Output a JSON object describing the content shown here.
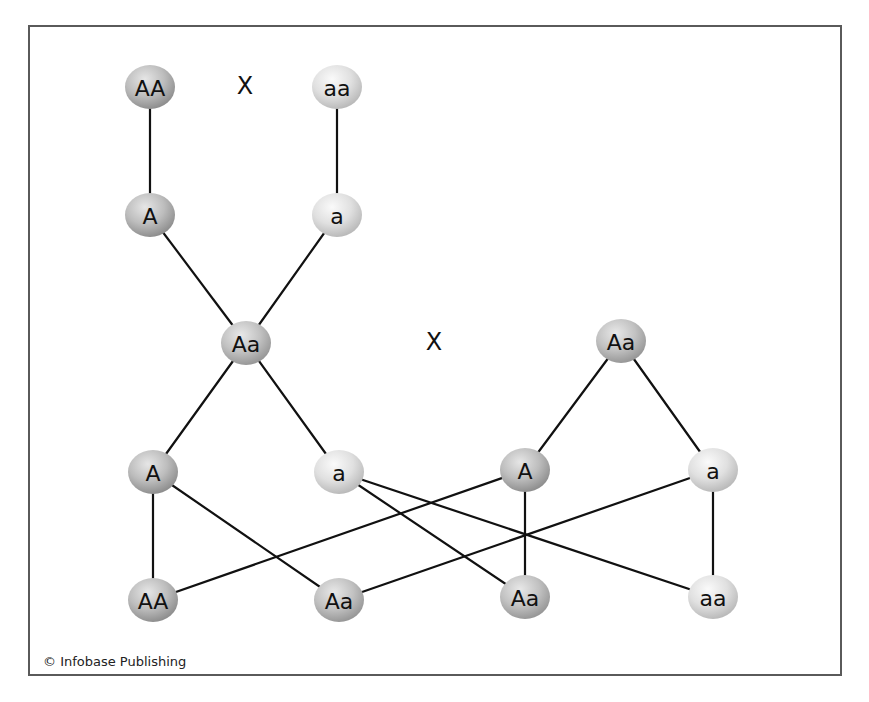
{
  "diagram": {
    "colors": {
      "border": "#5a5a5a",
      "edge": "#111111",
      "dominant_dark": "#9c9c9c",
      "dominant_light": "#dedede",
      "hetero_dark": "#a6a6a6",
      "hetero_light": "#e2e2e2",
      "recessive_dark": "#c4c4c4",
      "recessive_light": "#f4f4f4"
    },
    "cross_symbols": [
      {
        "id": "cross-top",
        "label": "X",
        "x": 245,
        "y": 86
      },
      {
        "id": "cross-middle",
        "label": "X",
        "x": 434,
        "y": 342
      }
    ],
    "nodes": [
      {
        "id": "p1",
        "label": "AA",
        "kind": "dominant",
        "x": 150,
        "y": 87,
        "role": "parent genotype"
      },
      {
        "id": "p2",
        "label": "aa",
        "kind": "recessive",
        "x": 337,
        "y": 87,
        "role": "parent genotype"
      },
      {
        "id": "g1",
        "label": "A",
        "kind": "dominant",
        "x": 150,
        "y": 215,
        "role": "parent gamete"
      },
      {
        "id": "g2",
        "label": "a",
        "kind": "recessive",
        "x": 337,
        "y": 215,
        "role": "parent gamete"
      },
      {
        "id": "f1a",
        "label": "Aa",
        "kind": "hetero",
        "x": 246,
        "y": 343,
        "role": "F1 genotype"
      },
      {
        "id": "f1b",
        "label": "Aa",
        "kind": "hetero",
        "x": 621,
        "y": 341,
        "role": "F1 genotype"
      },
      {
        "id": "f1a_g1",
        "label": "A",
        "kind": "dominant",
        "x": 153,
        "y": 472,
        "role": "F1 gamete"
      },
      {
        "id": "f1a_g2",
        "label": "a",
        "kind": "recessive",
        "x": 339,
        "y": 472,
        "role": "F1 gamete"
      },
      {
        "id": "f1b_g1",
        "label": "A",
        "kind": "dominant",
        "x": 525,
        "y": 470,
        "role": "F1 gamete"
      },
      {
        "id": "f1b_g2",
        "label": "a",
        "kind": "recessive",
        "x": 713,
        "y": 470,
        "role": "F1 gamete"
      },
      {
        "id": "f2_1",
        "label": "AA",
        "kind": "dominant",
        "x": 153,
        "y": 600,
        "role": "F2 genotype"
      },
      {
        "id": "f2_2",
        "label": "Aa",
        "kind": "hetero",
        "x": 339,
        "y": 600,
        "role": "F2 genotype"
      },
      {
        "id": "f2_3",
        "label": "Aa",
        "kind": "hetero",
        "x": 525,
        "y": 597,
        "role": "F2 genotype"
      },
      {
        "id": "f2_4",
        "label": "aa",
        "kind": "recessive",
        "x": 713,
        "y": 597,
        "role": "F2 genotype"
      }
    ],
    "edges": [
      [
        "p1",
        "g1"
      ],
      [
        "p2",
        "g2"
      ],
      [
        "g1",
        "f1a"
      ],
      [
        "g2",
        "f1a"
      ],
      [
        "f1a",
        "f1a_g1"
      ],
      [
        "f1a",
        "f1a_g2"
      ],
      [
        "f1b",
        "f1b_g1"
      ],
      [
        "f1b",
        "f1b_g2"
      ],
      [
        "f1a_g1",
        "f2_1"
      ],
      [
        "f1a_g1",
        "f2_2"
      ],
      [
        "f1b_g1",
        "f2_1"
      ],
      [
        "f1b_g1",
        "f2_3"
      ],
      [
        "f1a_g2",
        "f2_3"
      ],
      [
        "f1a_g2",
        "f2_4"
      ],
      [
        "f1b_g2",
        "f2_2"
      ],
      [
        "f1b_g2",
        "f2_4"
      ]
    ],
    "node_size": {
      "rx": 25,
      "ry": 22
    }
  },
  "footer": {
    "copyright": "© Infobase Publishing"
  }
}
